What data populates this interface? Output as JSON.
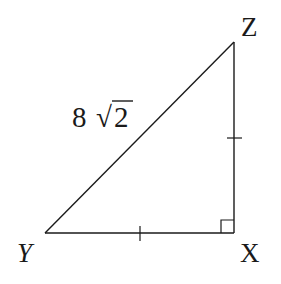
{
  "figure": {
    "type": "right-triangle",
    "vertices": {
      "Y": {
        "label": "Y",
        "x": 45,
        "y": 233
      },
      "X": {
        "label": "X",
        "x": 234,
        "y": 233
      },
      "Z": {
        "label": "Z",
        "x": 234,
        "y": 42
      }
    },
    "hypotenuse_label": {
      "coefficient": "8",
      "radical_symbol": "√",
      "radicand": "2",
      "text": "8 √2"
    },
    "right_angle_at": "X",
    "congruent_sides": [
      "YX",
      "XZ"
    ],
    "stroke_color": "#1a1a1a",
    "background_color": "#ffffff"
  }
}
